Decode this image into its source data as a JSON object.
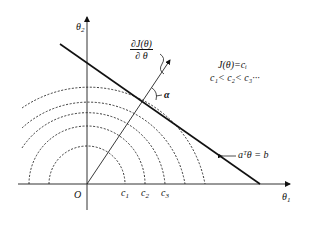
{
  "diagram": {
    "axes": {
      "x_label": "θ",
      "x_sub": "1",
      "y_label": "θ",
      "y_sub": "2",
      "origin_label": "O"
    },
    "contours": {
      "labels": [
        "c",
        "c",
        "c"
      ],
      "subs": [
        "1",
        "2",
        "3"
      ]
    },
    "gradient": {
      "num": "∂J(θ)",
      "den": "∂ θ"
    },
    "angle_label": "α",
    "constraint_label": "aᵀθ = b",
    "legend": {
      "line1": "J(θ)=cᵢ",
      "line2": "c₁< c₂< c₃···"
    }
  }
}
